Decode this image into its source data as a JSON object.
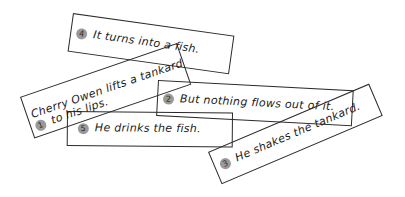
{
  "diagram": {
    "type": "sequencing-cards",
    "cards": [
      {
        "number": "1",
        "text_line1": "Cherry Owen lifts a tankard",
        "text_line2": "to his lips."
      },
      {
        "number": "2",
        "text": "But nothing flows out of it."
      },
      {
        "number": "3",
        "text": "He shakes the tankard."
      },
      {
        "number": "4",
        "text": "It turns into a fish."
      },
      {
        "number": "5",
        "text": "He drinks the fish."
      }
    ],
    "colors": {
      "border": "#2a2a2a",
      "badge": "#9a9a9a",
      "background": "#ffffff"
    }
  }
}
